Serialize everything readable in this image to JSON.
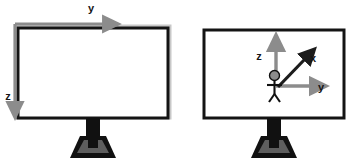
{
  "figure": {
    "background_color": "#ffffff",
    "width": 350,
    "height": 168
  },
  "colors": {
    "monitor_frame": "#141414",
    "monitor_screen": "#ffffff",
    "monitor_shadow": "#b4b4b4",
    "stand_dark": "#111111",
    "stand_base_fill": "#5e5e5e",
    "arrow_gray": "#8c8c8c",
    "arrow_dark": "#1c1c1c",
    "label_text": "#141414",
    "figure_head": "#8c8c8c",
    "figure_body": "#111111"
  },
  "panels": [
    {
      "id": "left-monitor",
      "name": "screen-coordinate-monitor",
      "description": "Monitor with screen-space 2D axes drawn outside the frame",
      "axes": [
        {
          "id": "left-y-axis",
          "label": "y",
          "direction": "right",
          "color": "arrow_gray",
          "label_x": 91,
          "label_y": 12
        },
        {
          "id": "left-z-axis",
          "label": "z",
          "direction": "down",
          "color": "arrow_gray",
          "label_x": 8,
          "label_y": 100
        }
      ]
    },
    {
      "id": "right-monitor",
      "name": "world-coordinate-monitor",
      "description": "Monitor showing a stick figure at the origin of a 3D x/y/z coordinate frame",
      "axes": [
        {
          "id": "right-z-axis",
          "label": "z",
          "direction": "up",
          "color": "arrow_gray",
          "label_x": 259,
          "label_y": 60
        },
        {
          "id": "right-x-axis",
          "label": "x",
          "direction": "up-right-diagonal",
          "color": "arrow_dark",
          "label_x": 311,
          "label_y": 62
        },
        {
          "id": "right-y-axis",
          "label": "y",
          "direction": "right",
          "color": "arrow_gray",
          "label_x": 320,
          "label_y": 92
        }
      ],
      "figure_icon": {
        "name": "stick-figure",
        "label": "observer"
      }
    }
  ]
}
